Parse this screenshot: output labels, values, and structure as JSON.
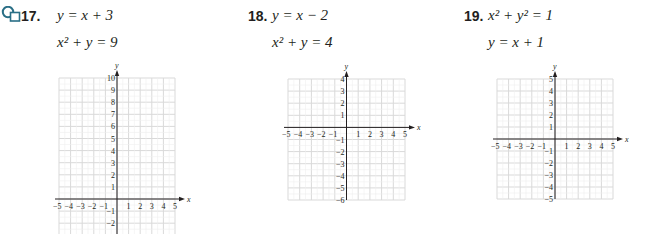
{
  "problems": [
    {
      "number": "17.",
      "icon": "graphing-calculator-icon",
      "equations": [
        "y = x + 3",
        "x² + y = 9"
      ],
      "eq1_html": "y = x + 3",
      "eq2_html": "x² + y = 9"
    },
    {
      "number": "18.",
      "equations": [
        "y = x − 2",
        "x² + y = 4"
      ],
      "eq1_html": "y = x − 2",
      "eq2_html": "x² + y = 4"
    },
    {
      "number": "19.",
      "equations": [
        "x² + y² = 1",
        "y = x + 1"
      ],
      "eq1_html": "x² + y² = 1",
      "eq2_html": "y = x + 1"
    }
  ],
  "colors": {
    "grid": "#d9d9d9",
    "axis": "#231f20",
    "icon": "#2a6f86",
    "text": "#231f20"
  },
  "chart_data": [
    {
      "type": "grid",
      "title": "17",
      "xlabel": "x",
      "ylabel": "y",
      "xlim": [
        -5,
        5
      ],
      "ylim": [
        -3,
        10
      ],
      "x_ticks": [
        -5,
        -4,
        -3,
        -2,
        -1,
        1,
        2,
        3,
        4,
        5
      ],
      "y_ticks": [
        10,
        9,
        8,
        7,
        6,
        5,
        4,
        3,
        2,
        1,
        -1,
        -2
      ],
      "grid": true
    },
    {
      "type": "grid",
      "title": "18",
      "xlabel": "x",
      "ylabel": "y",
      "xlim": [
        -5,
        5
      ],
      "ylim": [
        -6,
        4
      ],
      "x_ticks": [
        -5,
        -4,
        -3,
        -2,
        -1,
        1,
        2,
        3,
        4,
        5
      ],
      "y_ticks": [
        4,
        3,
        2,
        1,
        -1,
        -2,
        -3,
        -4,
        -5,
        -6
      ],
      "grid": true
    },
    {
      "type": "grid",
      "title": "19",
      "xlabel": "x",
      "ylabel": "y",
      "xlim": [
        -5,
        5
      ],
      "ylim": [
        -5,
        5
      ],
      "x_ticks": [
        -5,
        -4,
        -3,
        -2,
        -1,
        1,
        2,
        3,
        4,
        5
      ],
      "y_ticks": [
        5,
        4,
        3,
        2,
        1,
        -1,
        -2,
        -3,
        -4,
        -5
      ],
      "grid": true
    }
  ]
}
